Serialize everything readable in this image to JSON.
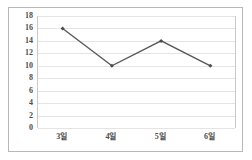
{
  "chart_data": {
    "type": "line",
    "title": "",
    "subtitle": "",
    "xlabel": "",
    "ylabel": "",
    "categories": [
      "3일",
      "4일",
      "5일",
      "6일"
    ],
    "values": [
      16,
      10,
      14,
      10
    ],
    "series": [
      {
        "name": "",
        "values": [
          16,
          10,
          14,
          10
        ]
      }
    ],
    "ylim": [
      0,
      18
    ],
    "ytick_step": 2,
    "ytick_labels": [
      "18",
      "16",
      "14",
      "12",
      "10",
      "8",
      "6",
      "4",
      "2",
      "0"
    ],
    "ytick_values": [
      18,
      16,
      14,
      12,
      10,
      8,
      6,
      4,
      2,
      0
    ],
    "grid": true,
    "grid_axis": "y",
    "legend": false,
    "legend_position": "none",
    "marker": "diamond",
    "annotations": []
  },
  "style": {
    "line_color": "#595959",
    "marker_color": "#4a4a4a",
    "gridline_color": "#e4e4e4",
    "axis_line_color": "#c9c9c9",
    "frame_border_color": "#b8b8b8",
    "label_color": "#4d4d4d",
    "background_color": "#ffffff"
  }
}
